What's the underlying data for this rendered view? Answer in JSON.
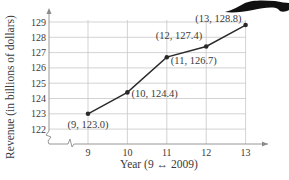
{
  "chart_data": {
    "type": "line",
    "title": "",
    "xlabel": "Year (9 ↔ 2009)",
    "ylabel": "Revenue (in billions of dollars)",
    "x": [
      9,
      10,
      11,
      12,
      13
    ],
    "series": [
      {
        "name": "Revenue",
        "values": [
          123.0,
          124.4,
          126.7,
          127.4,
          128.8
        ]
      }
    ],
    "point_labels": [
      "(9, 123.0)",
      "(10, 124.4)",
      "(11, 126.7)",
      "(12, 127.4)",
      "(13, 128.8)"
    ],
    "x_ticks": [
      "9",
      "10",
      "11",
      "12",
      "13"
    ],
    "y_ticks": [
      "122",
      "123",
      "124",
      "125",
      "126",
      "127",
      "128",
      "129"
    ],
    "xlim": [
      8,
      13.5
    ],
    "ylim": [
      121.5,
      129.5
    ],
    "y_axis_break": true,
    "grid": true,
    "legend": "none"
  },
  "colors": {
    "line": "#2a2a2a",
    "grid": "#c8c8c8",
    "axis": "#8a8a8a",
    "text": "#3a3a3a"
  }
}
